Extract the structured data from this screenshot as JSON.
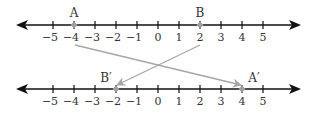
{
  "diagram": {
    "type": "number-line-reflection",
    "colors": {
      "axis": "#111111",
      "point": "#a0a0a0",
      "mapping_arrow": "#a6a6a6",
      "text": "#333333"
    },
    "tick_values": [
      -5,
      -4,
      -3,
      -2,
      -1,
      0,
      1,
      2,
      3,
      4,
      5
    ],
    "tick_labels": [
      "−5",
      "−4",
      "−3",
      "−2",
      "−1",
      "0",
      "1",
      "2",
      "3",
      "4",
      "5"
    ],
    "top_line": {
      "points": [
        {
          "label": "A",
          "value": -4
        },
        {
          "label": "B",
          "value": 2
        }
      ]
    },
    "bottom_line": {
      "points": [
        {
          "label": "B′",
          "value": -2
        },
        {
          "label": "A′",
          "value": 4
        }
      ]
    },
    "mappings": [
      {
        "from": "A",
        "to": "A′",
        "from_value": -4,
        "to_value": 4
      },
      {
        "from": "B",
        "to": "B′",
        "from_value": 2,
        "to_value": -2
      }
    ]
  }
}
